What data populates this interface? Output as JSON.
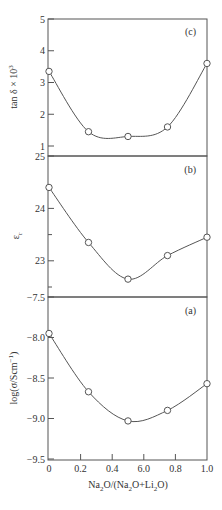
{
  "chart_data": [
    {
      "type": "line",
      "panel": "(c)",
      "title": "",
      "xlabel": "",
      "ylabel": "tan δ × 10³",
      "ylim": [
        1,
        5
      ],
      "yticks": [
        1,
        2,
        3,
        4,
        5
      ],
      "ytick_labels": [
        "1",
        "2",
        "3",
        "4",
        "5"
      ],
      "grid": false,
      "markers": "open-circle",
      "smooth_curve": true,
      "x": [
        0,
        0.25,
        0.5,
        0.75,
        1.0
      ],
      "values": [
        3.35,
        1.45,
        1.3,
        1.6,
        3.6
      ]
    },
    {
      "type": "line",
      "panel": "(b)",
      "title": "",
      "xlabel": "",
      "ylabel": "εr",
      "ylim": [
        22.5,
        25
      ],
      "yticks": [
        23,
        24,
        25
      ],
      "ytick_labels": [
        "23",
        "24",
        "25"
      ],
      "minor_yticks": [
        22.5,
        23.5
      ],
      "grid": false,
      "markers": "open-circle",
      "smooth_curve": true,
      "x": [
        0,
        0.25,
        0.5,
        0.75,
        1.0
      ],
      "values": [
        24.4,
        23.35,
        22.65,
        23.1,
        23.45
      ]
    },
    {
      "type": "line",
      "panel": "(a)",
      "title": "",
      "xlabel": "Na2O/(Na2O+Li2O)",
      "ylabel": "log(σ/Scm⁻¹)",
      "ylim": [
        -9.5,
        -7.5
      ],
      "yticks": [
        -9.5,
        -9.0,
        -8.5,
        -8.0,
        -7.5
      ],
      "ytick_labels": [
        "−9.5",
        "−9.0",
        "−8.5",
        "−8.0",
        "−7.5"
      ],
      "xlim": [
        0,
        1.0
      ],
      "xticks": [
        0,
        0.2,
        0.4,
        0.6,
        0.8,
        1.0
      ],
      "xtick_labels": [
        "0",
        "0.2",
        "0.4",
        "6.0",
        "0.8",
        "1.0"
      ],
      "grid": false,
      "markers": "open-circle",
      "smooth_curve": true,
      "x": [
        0,
        0.25,
        0.5,
        0.75,
        1.0
      ],
      "values": [
        -7.95,
        -8.67,
        -9.03,
        -8.9,
        -8.57
      ]
    }
  ],
  "labels": {
    "panel_c": "(c)",
    "panel_b": "(b)",
    "panel_a": "(a)",
    "ylabel_c": "tan δ × 10",
    "ylabel_c_sup": "3",
    "ylabel_b_main": "ε",
    "ylabel_b_sub": "r",
    "ylabel_a_main": "log(σ/Scm",
    "ylabel_a_sup": "−1",
    "ylabel_a_close": ")",
    "xlabel_parts": [
      "Na",
      "2",
      "O/(Na",
      "2",
      "O+Li",
      "2",
      "O)"
    ]
  },
  "colors": {
    "axis": "#555555",
    "curve": "#555555",
    "marker_fill": "#ffffff",
    "marker_stroke": "#555555",
    "text": "#333333"
  }
}
